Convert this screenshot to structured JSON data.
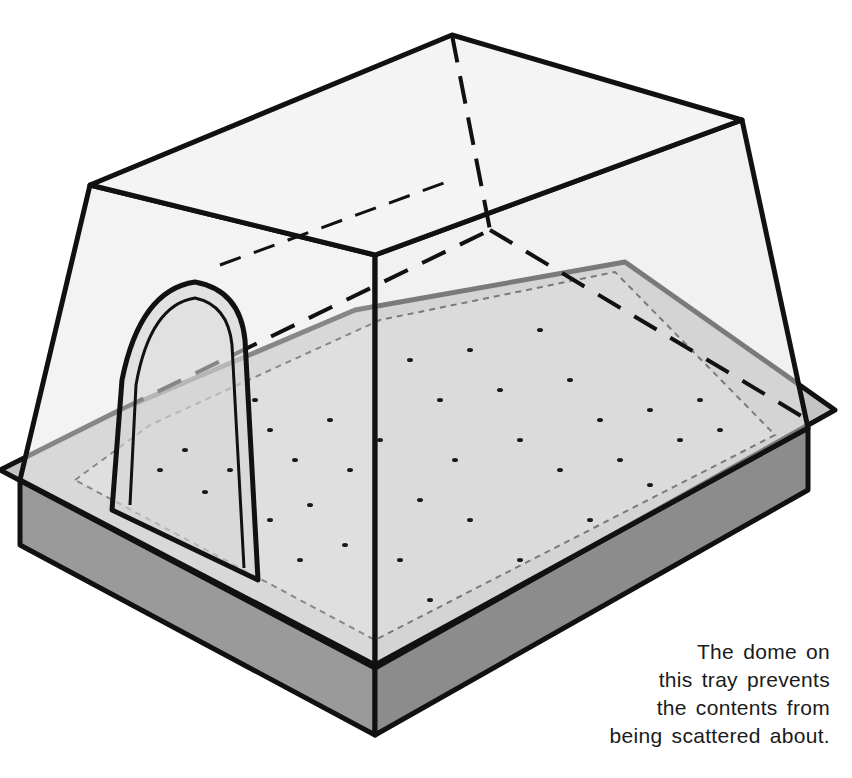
{
  "illustration": {
    "subject": "seed tray with clear dome lid",
    "colors": {
      "line": "#111111",
      "tray_side": "#9a9a9a",
      "tray_rim": "#c4c4c4",
      "soil": "#cfcfcf",
      "dome_glass": "#e6e6e6",
      "seed": "#1a1a1a"
    }
  },
  "caption": {
    "lines": [
      "The dome on",
      "this tray prevents",
      "the contents from",
      "being scattered about."
    ]
  }
}
